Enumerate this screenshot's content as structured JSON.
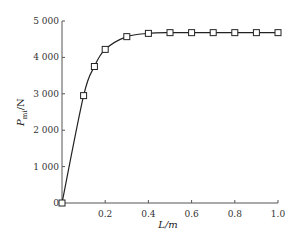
{
  "chart_data": {
    "type": "line",
    "title": "",
    "xlabel": "L/m",
    "ylabel": "P_mi/N",
    "ylabel_main": "P",
    "ylabel_sub": "mi",
    "ylabel_unit": "/N",
    "xlim": [
      0,
      1.0
    ],
    "ylim": [
      0,
      5000
    ],
    "x_ticks": [
      0.2,
      0.4,
      0.6,
      0.8,
      1.0
    ],
    "x_tick_labels": [
      "0.2",
      "0.4",
      "0.6",
      "0.8",
      "1.0"
    ],
    "y_ticks": [
      0,
      1000,
      2000,
      3000,
      4000,
      5000
    ],
    "y_tick_labels": [
      "0",
      "1 000",
      "2 000",
      "3 000",
      "4 000",
      "5 000"
    ],
    "grid": false,
    "legend": null,
    "marker": "square",
    "series": [
      {
        "name": "P_mi",
        "x": [
          0,
          0.1,
          0.15,
          0.2,
          0.3,
          0.4,
          0.5,
          0.6,
          0.7,
          0.8,
          0.9,
          1.0
        ],
        "values": [
          0,
          2950,
          3750,
          4220,
          4570,
          4660,
          4680,
          4680,
          4680,
          4680,
          4680,
          4680
        ]
      }
    ]
  }
}
